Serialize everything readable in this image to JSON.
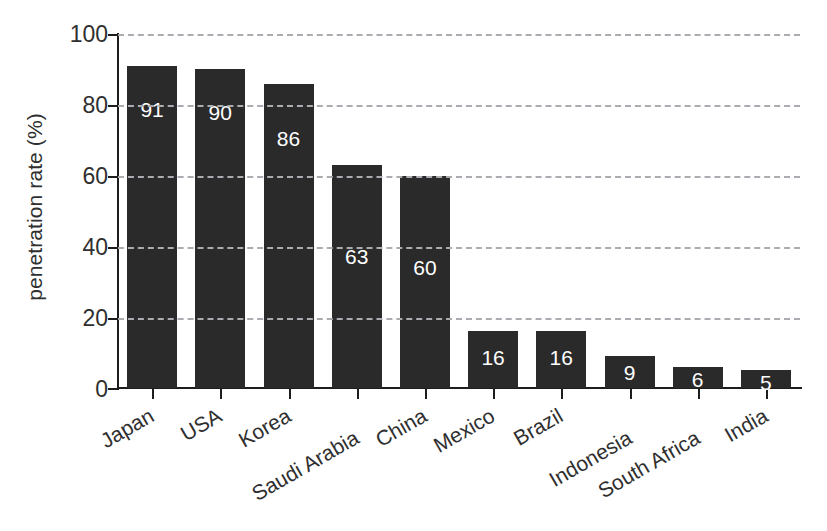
{
  "chart_data": {
    "type": "bar",
    "title": "",
    "xlabel": "",
    "ylabel": "penetration rate (%)",
    "ylim": [
      0,
      100
    ],
    "yticks": [
      0,
      20,
      40,
      60,
      80,
      100
    ],
    "grid": true,
    "legend": "none",
    "bar_color": "#2a2a2a",
    "gridline_color": "#a9acb0",
    "axis_color": "#1d1d1d",
    "value_label_color": "#ffffff",
    "categories": [
      "Japan",
      "USA",
      "Korea",
      "Saudi Arabia",
      "China",
      "Mexico",
      "Brazil",
      "Indonesia",
      "South Africa",
      "India"
    ],
    "values": [
      91,
      90,
      86,
      63,
      60,
      16,
      16,
      9,
      6,
      5
    ],
    "value_labels": [
      "91",
      "90",
      "86",
      "63",
      "60",
      "16",
      "16",
      "9",
      "6",
      "5"
    ],
    "ytick_labels": [
      "100",
      "80",
      "60",
      "40",
      "20",
      "0"
    ]
  }
}
